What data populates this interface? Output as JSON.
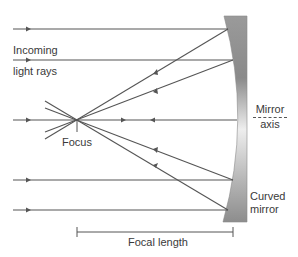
{
  "diagram": {
    "labels": {
      "incoming_line1": "Incoming",
      "incoming_line2": "light rays",
      "focus": "Focus",
      "mirror_axis_line1": "Mirror",
      "mirror_axis_line2": "axis",
      "curved_mirror_line1": "Curved",
      "curved_mirror_line2": "mirror",
      "focal_length": "Focal length"
    },
    "colors": {
      "ray": "#555555",
      "mirror_dark": "#8a8a8a",
      "mirror_light": "#e6e6e6",
      "text": "#3a3a3a"
    },
    "geometry": {
      "focus_point": [
        77,
        120
      ],
      "axis_y": 120,
      "incoming_rays_y": [
        29,
        60,
        120,
        180,
        210
      ],
      "mirror_hit_points": [
        [
          228,
          29
        ],
        [
          233,
          60
        ],
        [
          237,
          120
        ],
        [
          233,
          180
        ],
        [
          228,
          210
        ]
      ],
      "focal_length_bar": {
        "x1": 77,
        "x2": 233,
        "y": 232
      }
    }
  }
}
